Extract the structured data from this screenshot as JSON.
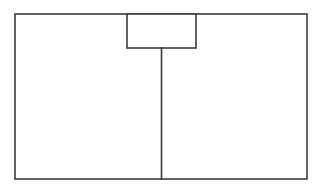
{
  "figure": {
    "title": "",
    "background_color": "#ffffff",
    "line_color": "#3b3b3b",
    "fill_color": "#ffffff",
    "line_width": 1.6,
    "canvas": {
      "width": 319,
      "height": 185
    },
    "shapes": [
      {
        "name": "outer-rectangle",
        "type": "rectangle",
        "x": 15,
        "y": 14,
        "width": 292,
        "height": 165,
        "label": ""
      },
      {
        "name": "inner-top-rectangle",
        "type": "rectangle",
        "x": 127,
        "y": 14,
        "width": 69,
        "height": 34,
        "label": ""
      },
      {
        "name": "vertical-divider-line",
        "type": "line",
        "x1": 161.5,
        "y1": 48,
        "x2": 161.5,
        "y2": 179,
        "label": ""
      }
    ]
  }
}
